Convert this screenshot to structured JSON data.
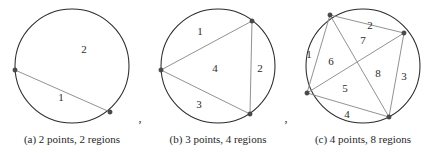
{
  "figure": {
    "kind": "circle-division-diagram",
    "width": 433,
    "height": 153,
    "background_color": "#ffffff",
    "circle_stroke_color": "#2b2b2b",
    "chord_stroke_color": "#8c8c8c",
    "vertex_color": "#4a4a4a",
    "label_color": "#2b2b2b",
    "separators": [
      {
        "text": ",",
        "x": 140,
        "y": 122
      },
      {
        "text": ",",
        "x": 286,
        "y": 122
      }
    ],
    "panels": [
      {
        "id": "panel-a",
        "caption": "(a) 2 points, 2 regions",
        "caption_x": 72,
        "caption_y": 140,
        "points_count": 2,
        "regions_count": 2,
        "circle": {
          "cx": 72,
          "cy": 66,
          "r": 57
        },
        "vertices": [
          {
            "id": "a1",
            "x": 15,
            "y": 70
          },
          {
            "id": "a2",
            "x": 110,
            "y": 112
          }
        ],
        "chords": [
          {
            "from": "a1",
            "to": "a2"
          }
        ],
        "region_labels": [
          {
            "text": "1",
            "x": 61,
            "y": 98
          },
          {
            "text": "2",
            "x": 84,
            "y": 50
          }
        ]
      },
      {
        "id": "panel-b",
        "caption": "(b) 3 points, 4 regions",
        "caption_x": 218,
        "caption_y": 140,
        "points_count": 3,
        "regions_count": 4,
        "circle": {
          "cx": 218,
          "cy": 66,
          "r": 57
        },
        "vertices": [
          {
            "id": "b1",
            "x": 161,
            "y": 70
          },
          {
            "id": "b2",
            "x": 252,
            "y": 21
          },
          {
            "id": "b3",
            "x": 250,
            "y": 114
          }
        ],
        "chords": [
          {
            "from": "b1",
            "to": "b2"
          },
          {
            "from": "b2",
            "to": "b3"
          },
          {
            "from": "b3",
            "to": "b1"
          }
        ],
        "region_labels": [
          {
            "text": "1",
            "x": 200,
            "y": 32
          },
          {
            "text": "2",
            "x": 260,
            "y": 69
          },
          {
            "text": "3",
            "x": 199,
            "y": 105
          },
          {
            "text": "4",
            "x": 215,
            "y": 69
          }
        ]
      },
      {
        "id": "panel-c",
        "caption": "(c) 4 points, 8 regions",
        "caption_x": 363,
        "caption_y": 140,
        "points_count": 4,
        "regions_count": 8,
        "circle": {
          "cx": 363,
          "cy": 66,
          "r": 57
        },
        "vertices": [
          {
            "id": "c1",
            "x": 330,
            "y": 15
          },
          {
            "id": "c2",
            "x": 404,
            "y": 33
          },
          {
            "id": "c3",
            "x": 389,
            "y": 117
          },
          {
            "id": "c4",
            "x": 307,
            "y": 93
          }
        ],
        "chords": [
          {
            "from": "c1",
            "to": "c2"
          },
          {
            "from": "c2",
            "to": "c3"
          },
          {
            "from": "c3",
            "to": "c4"
          },
          {
            "from": "c4",
            "to": "c1"
          },
          {
            "from": "c1",
            "to": "c3"
          },
          {
            "from": "c2",
            "to": "c4"
          }
        ],
        "region_labels": [
          {
            "text": "1",
            "x": 309,
            "y": 55
          },
          {
            "text": "2",
            "x": 370,
            "y": 26
          },
          {
            "text": "3",
            "x": 404,
            "y": 77
          },
          {
            "text": "4",
            "x": 347,
            "y": 115
          },
          {
            "text": "5",
            "x": 345,
            "y": 89
          },
          {
            "text": "6",
            "x": 331,
            "y": 62
          },
          {
            "text": "7",
            "x": 363,
            "y": 41
          },
          {
            "text": "8",
            "x": 378,
            "y": 74
          }
        ]
      }
    ]
  }
}
